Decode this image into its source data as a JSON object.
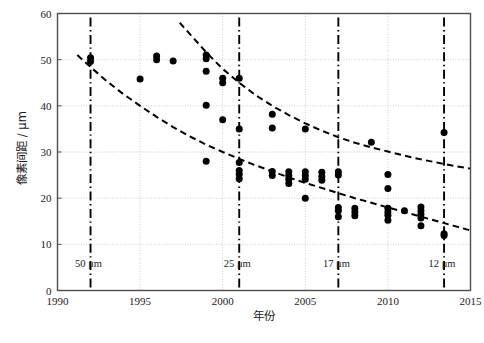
{
  "chart_data": {
    "type": "scatter",
    "title": "",
    "xlabel": "年份",
    "ylabel": "像素间距 / μm",
    "xlim": [
      1990,
      2015
    ],
    "ylim": [
      0,
      60
    ],
    "xticks": [
      1990,
      1995,
      2000,
      2005,
      2010,
      2015
    ],
    "xtick_labels": [
      "1990",
      "1995",
      "2000",
      "2005",
      "2010",
      "2015"
    ],
    "yticks": [
      0,
      10,
      20,
      30,
      40,
      50,
      60
    ],
    "ytick_labels": [
      "0",
      "10",
      "20",
      "30",
      "40",
      "50",
      "60"
    ],
    "grid": true,
    "legend": "none",
    "series": [
      {
        "name": "像素间距数据点",
        "marker": "filled-circle",
        "color": "#000000",
        "points": [
          [
            1992,
            49.6
          ],
          [
            1992,
            50.4
          ],
          [
            1995,
            45.8
          ],
          [
            1996,
            50.0
          ],
          [
            1996,
            50.8
          ],
          [
            1997,
            49.7
          ],
          [
            1999,
            50.2
          ],
          [
            1999,
            51.0
          ],
          [
            1999,
            47.5
          ],
          [
            1999,
            40.1
          ],
          [
            1999,
            28.0
          ],
          [
            2000,
            46.0
          ],
          [
            2000,
            45.0
          ],
          [
            2000,
            37.0
          ],
          [
            2001,
            46.0
          ],
          [
            2001,
            35.0
          ],
          [
            2001,
            27.7
          ],
          [
            2001,
            26.0
          ],
          [
            2001,
            25.2
          ],
          [
            2001,
            24.2
          ],
          [
            2003,
            38.2
          ],
          [
            2003,
            35.2
          ],
          [
            2003,
            25.8
          ],
          [
            2003,
            24.9
          ],
          [
            2004,
            25.7
          ],
          [
            2004,
            24.9
          ],
          [
            2004,
            24.1
          ],
          [
            2004,
            23.2
          ],
          [
            2005,
            35.0
          ],
          [
            2005,
            25.7
          ],
          [
            2005,
            24.9
          ],
          [
            2005,
            24.1
          ],
          [
            2005,
            20.0
          ],
          [
            2006,
            25.6
          ],
          [
            2006,
            24.7
          ],
          [
            2006,
            23.9
          ],
          [
            2007,
            25.7
          ],
          [
            2007,
            25.0
          ],
          [
            2007,
            18.0
          ],
          [
            2007,
            17.3
          ],
          [
            2007,
            16.0
          ],
          [
            2008,
            17.8
          ],
          [
            2008,
            17.0
          ],
          [
            2008,
            16.2
          ],
          [
            2009,
            32.1
          ],
          [
            2010,
            25.1
          ],
          [
            2010,
            22.1
          ],
          [
            2010,
            17.8
          ],
          [
            2010,
            17.0
          ],
          [
            2010,
            16.3
          ],
          [
            2010,
            15.2
          ],
          [
            2011,
            17.3
          ],
          [
            2012,
            18.1
          ],
          [
            2012,
            17.3
          ],
          [
            2012,
            16.5
          ],
          [
            2012,
            15.7
          ],
          [
            2012,
            14.0
          ],
          [
            2013.4,
            34.2
          ],
          [
            2013.4,
            12.3
          ],
          [
            2013.4,
            11.9
          ]
        ]
      }
    ],
    "trend_curves": [
      {
        "name": "upper-bound-dashed-curve",
        "style": "dashed",
        "color": "#000000",
        "points": [
          [
            1997.4,
            58.0
          ],
          [
            1998.2,
            54.8
          ],
          [
            1999.0,
            51.6
          ],
          [
            2000.0,
            48.0
          ],
          [
            2001.0,
            45.0
          ],
          [
            2002.0,
            42.3
          ],
          [
            2003.0,
            40.0
          ],
          [
            2004.0,
            38.0
          ],
          [
            2005.0,
            36.2
          ],
          [
            2006.0,
            34.6
          ],
          [
            2007.0,
            33.2
          ],
          [
            2008.0,
            32.0
          ],
          [
            2009.0,
            31.0
          ],
          [
            2010.0,
            30.1
          ],
          [
            2011.0,
            29.2
          ],
          [
            2012.0,
            28.4
          ],
          [
            2013.0,
            27.7
          ],
          [
            2014.0,
            27.0
          ],
          [
            2015.0,
            26.4
          ]
        ]
      },
      {
        "name": "lower-bound-dashed-curve",
        "style": "dashed",
        "color": "#000000",
        "points": [
          [
            1991.2,
            51.0
          ],
          [
            1992.0,
            48.4
          ],
          [
            1993.0,
            45.3
          ],
          [
            1994.0,
            42.5
          ],
          [
            1995.0,
            40.0
          ],
          [
            1996.0,
            37.6
          ],
          [
            1997.0,
            35.4
          ],
          [
            1998.0,
            33.4
          ],
          [
            1999.0,
            31.6
          ],
          [
            2000.0,
            30.0
          ],
          [
            2001.0,
            28.5
          ],
          [
            2002.0,
            27.1
          ],
          [
            2003.0,
            25.8
          ],
          [
            2004.0,
            24.5
          ],
          [
            2005.0,
            23.3
          ],
          [
            2006.0,
            22.2
          ],
          [
            2007.0,
            21.1
          ],
          [
            2008.0,
            20.0
          ],
          [
            2009.0,
            19.0
          ],
          [
            2010.0,
            18.0
          ],
          [
            2011.0,
            17.0
          ],
          [
            2012.0,
            16.0
          ],
          [
            2013.0,
            15.0
          ],
          [
            2014.0,
            14.0
          ],
          [
            2015.0,
            13.0
          ]
        ]
      }
    ],
    "node_markers": [
      {
        "year": 1992,
        "label": "50 μm"
      },
      {
        "year": 2001,
        "label": "25 μm"
      },
      {
        "year": 2007,
        "label": "17 μm"
      },
      {
        "year": 2013.4,
        "label": "12 μm"
      }
    ],
    "node_label_y": 5.0,
    "colors": {
      "axis": "#4d4d4d",
      "grid": "#bfbfbf",
      "marker": "#000000",
      "dash_curve": "#000000",
      "node_line": "#000000"
    }
  },
  "caption": {
    "text": ""
  }
}
